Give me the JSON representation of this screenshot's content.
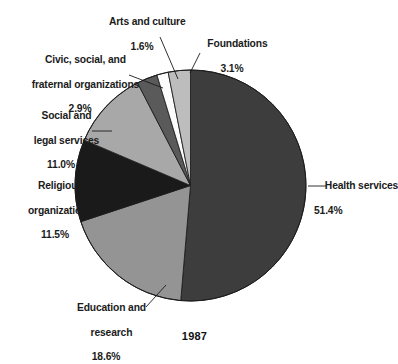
{
  "figure": {
    "year_label": "1987",
    "background_color": "#ffffff",
    "text_color": "#1b1b1b"
  },
  "chart_data": {
    "type": "pie",
    "title": "",
    "subtitle": "",
    "xlabel": "",
    "ylabel": "",
    "legend_position": "none",
    "grid": false,
    "annotation": "1987",
    "units": "percent",
    "total": 100.1,
    "start_angle_deg": 0,
    "direction": "clockwise",
    "categories": [
      "Health services",
      "Education and research",
      "Religious organizations",
      "Social and legal services",
      "Civic, social, and fraternal organizations",
      "Arts and culture",
      "Foundations"
    ],
    "values": [
      51.4,
      18.6,
      11.5,
      11.0,
      2.9,
      1.6,
      3.1
    ],
    "colors": [
      "#3d3d3d",
      "#949494",
      "#1a1a1a",
      "#a8a8a8",
      "#5a5a5a",
      "#fbfbfb",
      "#bdbdbd"
    ],
    "slices": [
      {
        "name": "Health services",
        "value": 51.4,
        "value_text": "51.4%",
        "color": "#3d3d3d",
        "label_lines": [
          "Health services"
        ],
        "label_text": "Health services 51.4%"
      },
      {
        "name": "Education and research",
        "value": 18.6,
        "value_text": "18.6%",
        "color": "#949494",
        "label_lines": [
          "Education and",
          "research"
        ],
        "label_text": "Education and research 18.6%"
      },
      {
        "name": "Religious organizations",
        "value": 11.5,
        "value_text": "11.5%",
        "color": "#1a1a1a",
        "label_lines": [
          "Religious",
          "organizations"
        ],
        "label_text": "Religious organizations 11.5%"
      },
      {
        "name": "Social and legal services",
        "value": 11.0,
        "value_text": "11.0%",
        "color": "#a8a8a8",
        "label_lines": [
          "Social and",
          "legal services"
        ],
        "label_text": "Social and legal services 11.0%"
      },
      {
        "name": "Civic, social, and fraternal organizations",
        "value": 2.9,
        "value_text": "2.9%",
        "color": "#5a5a5a",
        "label_lines": [
          "Civic, social, and",
          "fraternal organizations"
        ],
        "label_text": "Civic, social, and fraternal organizations 2.9%"
      },
      {
        "name": "Arts and culture",
        "value": 1.6,
        "value_text": "1.6%",
        "color": "#fbfbfb",
        "label_lines": [
          "Arts and culture"
        ],
        "label_text": "Arts and culture 1.6%"
      },
      {
        "name": "Foundations",
        "value": 3.1,
        "value_text": "3.1%",
        "color": "#bdbdbd",
        "label_lines": [
          "Foundations"
        ],
        "label_text": "Foundations 3.1%"
      }
    ]
  },
  "labels": {
    "health": {
      "line1": "Health services",
      "pct": "51.4%"
    },
    "education": {
      "line1": "Education and",
      "line2": "research",
      "pct": "18.6%"
    },
    "religious": {
      "line1": "Religious",
      "line2": "organizations",
      "pct": "11.5%"
    },
    "social": {
      "line1": "Social and",
      "line2": "legal services",
      "pct": "11.0%"
    },
    "civic": {
      "line1": "Civic, social, and",
      "line2": "fraternal organizations",
      "pct": "2.9%"
    },
    "arts": {
      "line1": "Arts and culture",
      "pct": "1.6%"
    },
    "foundations": {
      "line1": "Foundations",
      "pct": "3.1%"
    }
  }
}
